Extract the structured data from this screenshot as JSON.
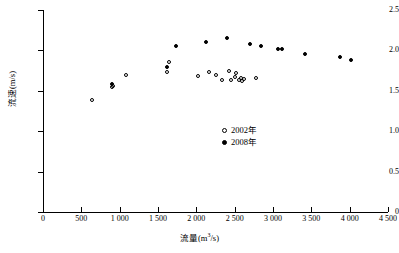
{
  "chart_data": {
    "type": "scatter",
    "title": "",
    "xlabel": "流量(m³/s)",
    "ylabel": "流速(m/s)",
    "xlim": [
      0,
      4500
    ],
    "ylim": [
      0,
      2.5
    ],
    "xticks": [
      0,
      500,
      1000,
      1500,
      2000,
      2500,
      3000,
      3500,
      4000,
      4500
    ],
    "xticklabels": [
      "0",
      "500",
      "1 000",
      "1 500",
      "2 000",
      "2 500",
      "3 000",
      "3 500",
      "4 000",
      "4 500"
    ],
    "yticks": [
      0,
      0.5,
      1.0,
      1.5,
      2.0,
      2.5
    ],
    "yticklabels": [
      "0",
      "0.5",
      "1.0",
      "1.5",
      "2.0",
      "2.5"
    ],
    "grid": false,
    "legend_position": "center-right",
    "series": [
      {
        "name": "2002年",
        "marker": "open-circle",
        "color": "#000000",
        "points": [
          [
            640,
            1.38
          ],
          [
            900,
            1.55
          ],
          [
            915,
            1.56
          ],
          [
            1080,
            1.7
          ],
          [
            1620,
            1.73
          ],
          [
            1640,
            1.86
          ],
          [
            2020,
            1.68
          ],
          [
            2160,
            1.73
          ],
          [
            2260,
            1.7
          ],
          [
            2330,
            1.63
          ],
          [
            2420,
            1.75
          ],
          [
            2450,
            1.63
          ],
          [
            2500,
            1.67
          ],
          [
            2520,
            1.72
          ],
          [
            2560,
            1.63
          ],
          [
            2580,
            1.66
          ],
          [
            2600,
            1.62
          ],
          [
            2620,
            1.64
          ],
          [
            2780,
            1.66
          ]
        ]
      },
      {
        "name": "2008年",
        "marker": "filled-circle",
        "color": "#000000",
        "points": [
          [
            905,
            1.59
          ],
          [
            1620,
            1.8
          ],
          [
            1740,
            2.06
          ],
          [
            2120,
            2.11
          ],
          [
            2400,
            2.15
          ],
          [
            2700,
            2.08
          ],
          [
            2840,
            2.05
          ],
          [
            3060,
            2.02
          ],
          [
            3120,
            2.02
          ],
          [
            3420,
            1.95
          ],
          [
            3880,
            1.92
          ],
          [
            4020,
            1.88
          ]
        ]
      }
    ]
  },
  "legend": {
    "items": [
      {
        "label": "2002年",
        "marker": "open"
      },
      {
        "label": "2008年",
        "marker": "filled"
      }
    ]
  }
}
